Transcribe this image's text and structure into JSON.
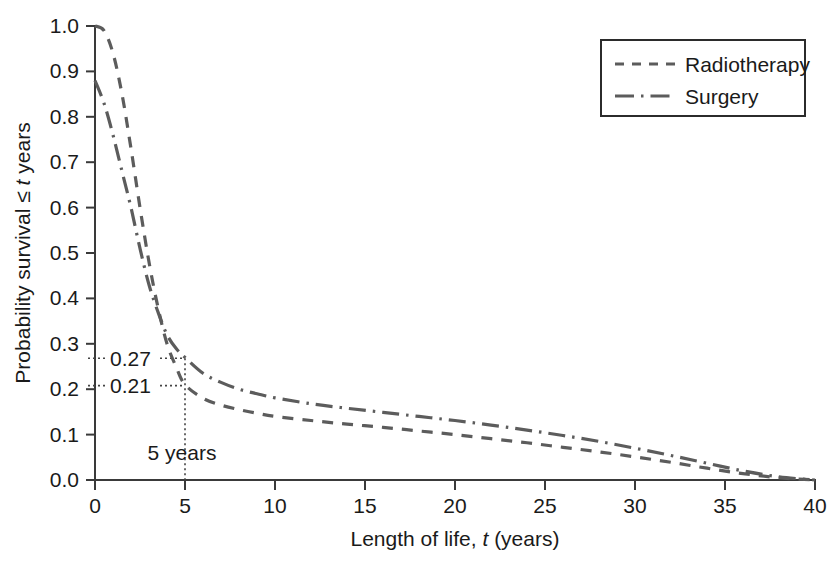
{
  "chart_data": {
    "type": "line",
    "title": "",
    "xlabel": "Length of life, t (years)",
    "xlabel_parts": {
      "pre": "Length of life, ",
      "italic": "t",
      "post": " (years)"
    },
    "ylabel": "Probability survival ≤ t years",
    "ylabel_parts": {
      "pre": "Probability survival ≤ ",
      "italic": "t",
      "post": " years"
    },
    "xlim": [
      0,
      40
    ],
    "ylim": [
      0,
      1.0
    ],
    "xticks": [
      "0",
      "5",
      "10",
      "15",
      "20",
      "25",
      "30",
      "35",
      "40"
    ],
    "xtick_values": [
      0,
      5,
      10,
      15,
      20,
      25,
      30,
      35,
      40
    ],
    "yticks": [
      "0.0",
      "0.1",
      "0.2",
      "0.3",
      "0.4",
      "0.5",
      "0.6",
      "0.7",
      "0.8",
      "0.9",
      "1.0"
    ],
    "ytick_values": [
      0.0,
      0.1,
      0.2,
      0.3,
      0.4,
      0.5,
      0.6,
      0.7,
      0.8,
      0.9,
      1.0
    ],
    "grid": false,
    "legend_position": "top-right",
    "series": [
      {
        "name": "Radiotherapy",
        "linestyle": "dashed",
        "color": "#5c5c5c",
        "x": [
          0,
          0.5,
          1,
          1.5,
          2,
          2.5,
          3,
          3.5,
          4,
          4.5,
          5,
          6,
          7,
          8,
          9,
          10,
          12,
          14,
          16,
          18,
          20,
          22,
          24,
          26,
          28,
          30,
          32,
          34,
          36,
          38,
          40
        ],
        "y": [
          1.0,
          0.99,
          0.94,
          0.85,
          0.73,
          0.6,
          0.48,
          0.38,
          0.3,
          0.25,
          0.21,
          0.18,
          0.165,
          0.155,
          0.147,
          0.14,
          0.131,
          0.123,
          0.116,
          0.108,
          0.1,
          0.091,
          0.082,
          0.072,
          0.062,
          0.051,
          0.039,
          0.026,
          0.014,
          0.005,
          0.0
        ]
      },
      {
        "name": "Surgery",
        "linestyle": "dash-dot",
        "color": "#5c5c5c",
        "x": [
          0,
          0.5,
          1,
          1.5,
          2,
          2.5,
          3,
          3.5,
          4,
          4.5,
          5,
          6,
          7,
          8,
          9,
          10,
          12,
          14,
          16,
          18,
          20,
          22,
          24,
          26,
          28,
          30,
          32,
          34,
          36,
          38,
          40
        ],
        "y": [
          0.88,
          0.83,
          0.76,
          0.68,
          0.6,
          0.51,
          0.43,
          0.37,
          0.32,
          0.29,
          0.27,
          0.235,
          0.215,
          0.2,
          0.19,
          0.181,
          0.168,
          0.158,
          0.149,
          0.14,
          0.131,
          0.121,
          0.11,
          0.098,
          0.085,
          0.07,
          0.054,
          0.037,
          0.02,
          0.007,
          0.0
        ]
      }
    ],
    "annotations": [
      {
        "id": "label-027",
        "text": "0.27",
        "value": 0.27,
        "series": "Surgery",
        "at_x": 5
      },
      {
        "id": "label-021",
        "text": "0.21",
        "value": 0.21,
        "series": "Radiotherapy",
        "at_x": 5
      },
      {
        "id": "label-5-years",
        "text": "5 years",
        "value": 5
      }
    ]
  },
  "legend": {
    "entries": [
      {
        "label": "Radiotherapy",
        "style": "dashed"
      },
      {
        "label": "Surgery",
        "style": "dash-dot"
      }
    ]
  },
  "axes": {
    "x_title_pre": "Length of life, ",
    "x_title_italic": "t",
    "x_title_post": " (years)",
    "y_title_pre": "Probability survival ≤ ",
    "y_title_italic": "t",
    "y_title_post": " years"
  },
  "ticks": {
    "x": [
      "0",
      "5",
      "10",
      "15",
      "20",
      "25",
      "30",
      "35",
      "40"
    ],
    "y": [
      "0.0",
      "0.1",
      "0.2",
      "0.3",
      "0.4",
      "0.5",
      "0.6",
      "0.7",
      "0.8",
      "0.9",
      "1.0"
    ]
  },
  "annotations": {
    "surgery_5yr": "0.27",
    "radiotherapy_5yr": "0.21",
    "five_years": "5 years"
  },
  "colors": {
    "curve": "#5c5c5c",
    "axis": "#3a3a3a",
    "text": "#1a1a1a",
    "background": "#ffffff"
  }
}
